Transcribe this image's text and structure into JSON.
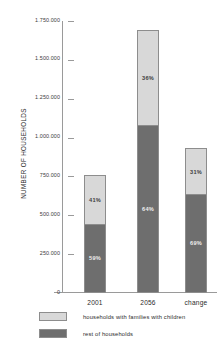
{
  "chart_data": {
    "type": "bar",
    "subtype": "stacked-percentage",
    "title": "",
    "xlabel": "",
    "ylabel": "NUMBER OF HOUSEHOLDS",
    "ylim": [
      0,
      1750000
    ],
    "ytick_step": 250000,
    "grid": false,
    "legend_position": "bottom-left",
    "categories": [
      "2001",
      "2056",
      "change"
    ],
    "ytick_labels": [
      "1.750.000",
      "1.500.000",
      "1.250.000",
      "1.000.000",
      "750.000",
      "500.000",
      "250.000",
      "0"
    ],
    "ytick_values": [
      1750000,
      1500000,
      1250000,
      1000000,
      750000,
      500000,
      250000,
      0
    ],
    "series": [
      {
        "name": "households with families with children",
        "color": "#d8d8d8",
        "values": [
          312000,
          608000,
          288000
        ],
        "percent_labels": [
          "41%",
          "36%",
          "31%"
        ]
      },
      {
        "name": "rest of households",
        "color": "#6e6e6e",
        "values": [
          448000,
          1082000,
          642000
        ],
        "percent_labels": [
          "59%",
          "64%",
          "69%"
        ]
      }
    ],
    "totals": [
      760000,
      1690000,
      930000
    ]
  },
  "legend": {
    "items": [
      {
        "label": "households with families with children",
        "swatch": "light"
      },
      {
        "label": "rest of households",
        "swatch": "dark"
      }
    ]
  },
  "colors": {
    "light_segment": "#d8d8d8",
    "dark_segment": "#6e6e6e",
    "axis": "#9a9a9a",
    "text": "#2b2b2b",
    "background": "#ffffff"
  }
}
